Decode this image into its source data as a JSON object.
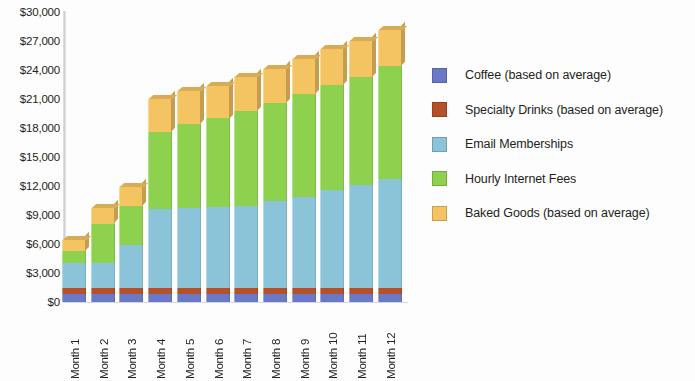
{
  "chart_data": {
    "type": "bar",
    "stacked": true,
    "title": "",
    "subtitle": "",
    "xlabel": "",
    "ylabel": "",
    "grid": false,
    "legend_position": "right",
    "ylim": [
      0,
      30000
    ],
    "ytick_labels": [
      "$30,000",
      "$27,000",
      "$24,000",
      "$21,000",
      "$18,000",
      "$15,000",
      "$12,000",
      "$9,000",
      "$6,000",
      "$3,000",
      "$0"
    ],
    "ytick_values": [
      30000,
      27000,
      24000,
      21000,
      18000,
      15000,
      12000,
      9000,
      6000,
      3000,
      0
    ],
    "categories": [
      "Month 1",
      "Month 2",
      "Month 3",
      "Month 4",
      "Month 5",
      "Month 6",
      "Month 7",
      "Month 8",
      "Month 9",
      "Month 10",
      "Month 11",
      "Month 12"
    ],
    "series": [
      {
        "name": "Coffee (based on average)",
        "color": "#6a78c8",
        "values": [
          800,
          800,
          800,
          800,
          800,
          800,
          800,
          800,
          800,
          800,
          800,
          800
        ]
      },
      {
        "name": "Specialty Drinks (based on average)",
        "color": "#b5512a",
        "values": [
          600,
          600,
          600,
          600,
          600,
          600,
          600,
          600,
          600,
          600,
          600,
          600
        ]
      },
      {
        "name": "Email Memberships",
        "color": "#8bc3d9",
        "values": [
          2600,
          2600,
          4500,
          8200,
          8300,
          8400,
          8500,
          9000,
          9500,
          10200,
          10700,
          11300
        ]
      },
      {
        "name": "Hourly Internet Fees",
        "color": "#8ed14f",
        "values": [
          1300,
          4100,
          4000,
          8000,
          8700,
          9200,
          9900,
          10200,
          10600,
          10900,
          11200,
          11700
        ]
      },
      {
        "name": "Baked Goods (based on average)",
        "color": "#f5c462",
        "values": [
          1100,
          1600,
          2000,
          3400,
          3400,
          3400,
          3500,
          3500,
          3600,
          3700,
          3700,
          3700
        ]
      }
    ],
    "totals": [
      6400,
      9700,
      11900,
      21000,
      21800,
      22400,
      23300,
      24100,
      25100,
      26200,
      27000,
      28100
    ]
  },
  "axis": {
    "baseline_color": "#d8d8dc",
    "axis_line_color": "#cfcfd6"
  }
}
